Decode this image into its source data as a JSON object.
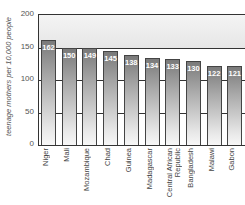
{
  "chart_data": {
    "type": "bar",
    "title": "",
    "xlabel": "",
    "ylabel": "teenage mothers per 10,000 people",
    "ylim": [
      0,
      200
    ],
    "yticks": [
      0,
      50,
      100,
      150,
      200
    ],
    "grid": true,
    "legend": null,
    "categories": [
      "Niger",
      "Mali",
      "Mozambique",
      "Chad",
      "Guinea",
      "Madagascar",
      "Central African Republic",
      "Bangladesh",
      "Malawi",
      "Gabon"
    ],
    "values": [
      162,
      150,
      149,
      145,
      138,
      134,
      133,
      130,
      122,
      121
    ],
    "data_labels": [
      "162",
      "150",
      "149",
      "145",
      "138",
      "134",
      "133",
      "130",
      "122",
      "121"
    ]
  },
  "axis": {
    "ytick_labels": [
      "0",
      "50",
      "100",
      "150",
      "200"
    ],
    "xtick_labels": [
      "Niger",
      "Mali",
      "Mozambique",
      "Chad",
      "Guinea",
      "Madagascar",
      "Central African\nRepublic",
      "Bangladesh",
      "Malawi",
      "Gabon"
    ]
  }
}
